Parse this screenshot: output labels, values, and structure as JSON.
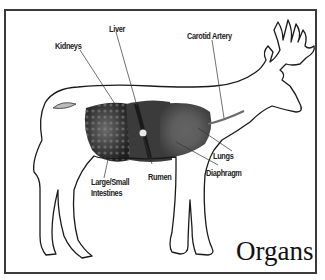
{
  "diagram": {
    "title": "Organs",
    "colors": {
      "outline": "#1a1a1a",
      "frame": "#3a3a3a",
      "organ_dark": "#2b2b2b",
      "organ_mid": "#5a5a5a",
      "leader_line": "#333333"
    },
    "labels": [
      {
        "id": "kidneys",
        "text": "Kidneys"
      },
      {
        "id": "liver",
        "text": "Liver"
      },
      {
        "id": "carotid",
        "text": "Carotid Artery"
      },
      {
        "id": "lungs",
        "text": "Lungs"
      },
      {
        "id": "diaphragm",
        "text": "Diaphragm"
      },
      {
        "id": "rumen",
        "text": "Rumen"
      },
      {
        "id": "intestines_1",
        "text": "Large/Small"
      },
      {
        "id": "intestines_2",
        "text": "Intestines"
      }
    ]
  }
}
